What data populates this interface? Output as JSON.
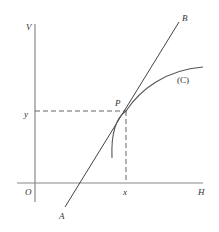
{
  "diagram": {
    "type": "tangent-to-curve",
    "colors": {
      "axis": "#888888",
      "line": "#444444",
      "curve": "#555555",
      "dash": "#666666",
      "text": "#333333"
    },
    "labels": {
      "vertical_axis": "V",
      "horizontal_axis": "H",
      "origin": "O",
      "point": "P",
      "x_coord": "x",
      "y_coord": "y",
      "line_start": "A",
      "line_end": "B",
      "curve": "(C)"
    },
    "elements": {
      "axes": [
        "V (vertical)",
        "H (horizontal)"
      ],
      "tangent_line": "AB through P",
      "curve": "(C) passing through P",
      "projections": "dashed lines from P to x on H-axis and y on V-axis"
    }
  }
}
